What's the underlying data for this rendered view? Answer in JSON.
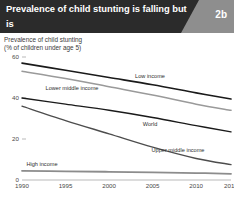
{
  "banner": {
    "title_line1": "Prevalence of child stunting is falling but is",
    "title_line2": "close to 40 percent in low-income countries",
    "badge": "2b",
    "dark_color": "#2b2b2b",
    "gray_color": "#8e8e8e",
    "text_color": "#ffffff"
  },
  "subtitle": {
    "line1": "Prevalence of child stunting",
    "line2": "(% of children under age 5)"
  },
  "chart_data": {
    "type": "line",
    "title": "Prevalence of child stunting",
    "subtitle": "(% of children under age 5)",
    "xlabel": "",
    "ylabel": "% of children under age 5",
    "x": [
      1990,
      1995,
      2000,
      2005,
      2010,
      2014
    ],
    "xlim": [
      1990,
      2014
    ],
    "ylim": [
      0,
      60
    ],
    "yticks": [
      0,
      20,
      40,
      60
    ],
    "ytick_labels": [
      "0",
      "20",
      "40",
      "60"
    ],
    "xtick_labels": [
      "1990",
      "1995",
      "2000",
      "2005",
      "2010",
      "2014"
    ],
    "grid": false,
    "legend": "inline-labels",
    "series": [
      {
        "name": "Low income",
        "label": "Low income",
        "color": "#1a1a1a",
        "width": 1.6,
        "values": [
          57.0,
          53.5,
          50.0,
          46.5,
          42.5,
          39.5
        ]
      },
      {
        "name": "Lower middle income",
        "label": "Lower middle income",
        "color": "#9a9a9a",
        "width": 1.5,
        "values": [
          53.0,
          49.5,
          45.5,
          41.5,
          37.0,
          34.0
        ]
      },
      {
        "name": "World",
        "label": "World",
        "color": "#1a1a1a",
        "width": 1.4,
        "values": [
          40.0,
          37.0,
          34.0,
          30.5,
          26.5,
          23.5
        ]
      },
      {
        "name": "Upper middle income",
        "label": "Upper middle income",
        "color": "#4d4d4d",
        "width": 1.4,
        "values": [
          36.0,
          29.0,
          22.5,
          16.0,
          10.5,
          7.5
        ]
      },
      {
        "name": "High income",
        "label": "High income",
        "color": "#8c8c8c",
        "width": 1.8,
        "values": [
          4.5,
          4.2,
          4.0,
          3.7,
          3.4,
          3.0
        ]
      }
    ]
  }
}
